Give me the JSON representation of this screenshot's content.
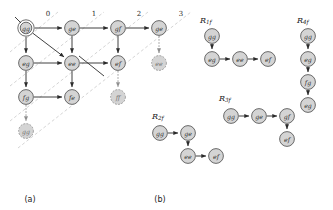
{
  "figure": {
    "captions": [
      {
        "id": "caption-a",
        "text": "(a)",
        "x": 30,
        "y": 199
      },
      {
        "id": "caption-b",
        "text": "(b)",
        "x": 160,
        "y": 199
      }
    ]
  },
  "panel_a": {
    "diagonal_labels": [
      {
        "text": "0",
        "x": 48,
        "y": 14
      },
      {
        "text": "1",
        "x": 94,
        "y": 14
      },
      {
        "text": "2",
        "x": 139,
        "y": 14
      },
      {
        "text": "3",
        "x": 181,
        "y": 14
      }
    ],
    "nodes": [
      {
        "id": "a-gg",
        "label": "gg",
        "x": 26,
        "y": 28,
        "r": 8.2,
        "accepting": true,
        "ghost": false
      },
      {
        "id": "a-ge-0",
        "label": "ge",
        "x": 72,
        "y": 28,
        "r": 7.4,
        "accepting": false,
        "ghost": false
      },
      {
        "id": "a-gf",
        "label": "gf",
        "x": 118,
        "y": 28,
        "r": 7.4,
        "accepting": false,
        "ghost": false
      },
      {
        "id": "a-ge-1",
        "label": "ge",
        "x": 159,
        "y": 28,
        "r": 7.4,
        "accepting": false,
        "ghost": false
      },
      {
        "id": "a-eg",
        "label": "eg",
        "x": 26,
        "y": 63,
        "r": 7.4,
        "accepting": false,
        "ghost": false
      },
      {
        "id": "a-ee",
        "label": "ee",
        "x": 72,
        "y": 63,
        "r": 7.4,
        "accepting": false,
        "ghost": false
      },
      {
        "id": "a-ef",
        "label": "ef",
        "x": 118,
        "y": 63,
        "r": 7.4,
        "accepting": false,
        "ghost": false
      },
      {
        "id": "a-ee-ghost",
        "label": "ee",
        "x": 159,
        "y": 63,
        "r": 7.4,
        "accepting": false,
        "ghost": true
      },
      {
        "id": "a-fg",
        "label": "fg",
        "x": 26,
        "y": 97,
        "r": 7.4,
        "accepting": false,
        "ghost": false
      },
      {
        "id": "a-fe",
        "label": "fe",
        "x": 72,
        "y": 97,
        "r": 7.4,
        "accepting": false,
        "ghost": false
      },
      {
        "id": "a-ff-ghost",
        "label": "ff",
        "x": 118,
        "y": 97,
        "r": 7.4,
        "accepting": false,
        "ghost": true
      },
      {
        "id": "a-gg-ghost",
        "label": "gg",
        "x": 26,
        "y": 131,
        "r": 7.4,
        "accepting": false,
        "ghost": true
      }
    ],
    "edges": [
      {
        "from": "a-gg",
        "to": "a-ge-0",
        "ghost": false
      },
      {
        "from": "a-ge-0",
        "to": "a-gf",
        "ghost": false
      },
      {
        "from": "a-gf",
        "to": "a-ge-1",
        "ghost": false
      },
      {
        "from": "a-gg",
        "to": "a-eg",
        "ghost": false
      },
      {
        "from": "a-gg",
        "to": "a-ee",
        "ghost": false
      },
      {
        "from": "a-ge-0",
        "to": "a-ee",
        "ghost": false
      },
      {
        "from": "a-gf",
        "to": "a-ef",
        "ghost": false
      },
      {
        "from": "a-eg",
        "to": "a-ee",
        "ghost": false
      },
      {
        "from": "a-ee",
        "to": "a-ef",
        "ghost": false
      },
      {
        "from": "a-eg",
        "to": "a-fg",
        "ghost": false
      },
      {
        "from": "a-ee",
        "to": "a-fe",
        "ghost": false
      },
      {
        "from": "a-fg",
        "to": "a-fe",
        "ghost": false
      },
      {
        "from": "a-ge-1",
        "to": "a-ee-ghost",
        "ghost": true
      },
      {
        "from": "a-ef",
        "to": "a-ff-ghost",
        "ghost": true
      },
      {
        "from": "a-fg",
        "to": "a-gg-ghost",
        "ghost": true
      }
    ],
    "cross_edge": {
      "from_x": 79,
      "from_y": 56,
      "to_x": 104,
      "to_y": 76
    },
    "start_arrow": {
      "x1": 15,
      "y1": 17,
      "x2": 21,
      "y2": 23
    },
    "diagonals": [
      {
        "x1": 10,
        "y1": 52,
        "x2": 58,
        "y2": 12
      },
      {
        "x1": 10,
        "y1": 86,
        "x2": 104,
        "y2": 12
      },
      {
        "x1": 10,
        "y1": 121,
        "x2": 148,
        "y2": 12
      },
      {
        "x1": 18,
        "y1": 148,
        "x2": 191,
        "y2": 12
      }
    ]
  },
  "panel_b": {
    "runs": [
      {
        "id": "run-R1f",
        "label_main": "R",
        "label_sub": "1f",
        "label_x": 200,
        "label_y": 20,
        "nodes": [
          {
            "id": "b1-gg",
            "label": "gg",
            "x": 212,
            "y": 36,
            "r": 7.4
          },
          {
            "id": "b1-eg",
            "label": "eg",
            "x": 212,
            "y": 59,
            "r": 7.4
          },
          {
            "id": "b1-ee",
            "label": "ee",
            "x": 240,
            "y": 59,
            "r": 7.4
          },
          {
            "id": "b1-ef",
            "label": "ef",
            "x": 268,
            "y": 59,
            "r": 7.4
          }
        ],
        "edges": [
          {
            "from": "b1-gg",
            "to": "b1-eg"
          },
          {
            "from": "b1-eg",
            "to": "b1-ee"
          },
          {
            "from": "b1-ee",
            "to": "b1-ef"
          }
        ]
      },
      {
        "id": "run-R4f",
        "label_main": "R",
        "label_sub": "4f",
        "label_x": 297,
        "label_y": 20,
        "nodes": [
          {
            "id": "b4-gg",
            "label": "gg",
            "x": 308,
            "y": 36,
            "r": 7.4
          },
          {
            "id": "b4-eg",
            "label": "eg",
            "x": 308,
            "y": 59,
            "r": 7.4
          },
          {
            "id": "b4-fg",
            "label": "fg",
            "x": 308,
            "y": 82,
            "r": 7.4
          },
          {
            "id": "b4-eg2",
            "label": "eg",
            "x": 308,
            "y": 105,
            "r": 7.4
          }
        ],
        "edges": [
          {
            "from": "b4-gg",
            "to": "b4-eg"
          },
          {
            "from": "b4-eg",
            "to": "b4-fg"
          },
          {
            "from": "b4-fg",
            "to": "b4-eg2"
          }
        ]
      },
      {
        "id": "run-R3f",
        "label_main": "R",
        "label_sub": "3f",
        "label_x": 219,
        "label_y": 98,
        "nodes": [
          {
            "id": "b3-gg",
            "label": "gg",
            "x": 231,
            "y": 116,
            "r": 7.4
          },
          {
            "id": "b3-ge",
            "label": "ge",
            "x": 259,
            "y": 116,
            "r": 7.4
          },
          {
            "id": "b3-gf",
            "label": "gf",
            "x": 287,
            "y": 116,
            "r": 7.4
          },
          {
            "id": "b3-ef",
            "label": "ef",
            "x": 287,
            "y": 139,
            "r": 7.4
          }
        ],
        "edges": [
          {
            "from": "b3-gg",
            "to": "b3-ge"
          },
          {
            "from": "b3-ge",
            "to": "b3-gf"
          },
          {
            "from": "b3-gf",
            "to": "b3-ef"
          }
        ]
      },
      {
        "id": "run-R2f",
        "label_main": "R",
        "label_sub": "2f",
        "label_x": 152,
        "label_y": 116,
        "nodes": [
          {
            "id": "b2-gg",
            "label": "gg",
            "x": 160,
            "y": 133,
            "r": 7.4
          },
          {
            "id": "b2-ge",
            "label": "ge",
            "x": 188,
            "y": 133,
            "r": 7.4
          },
          {
            "id": "b2-ee",
            "label": "ee",
            "x": 188,
            "y": 156,
            "r": 7.4
          },
          {
            "id": "b2-ef",
            "label": "ef",
            "x": 216,
            "y": 156,
            "r": 7.4
          }
        ],
        "edges": [
          {
            "from": "b2-gg",
            "to": "b2-ge"
          },
          {
            "from": "b2-ge",
            "to": "b2-ee"
          },
          {
            "from": "b2-ee",
            "to": "b2-ef"
          }
        ]
      }
    ]
  }
}
